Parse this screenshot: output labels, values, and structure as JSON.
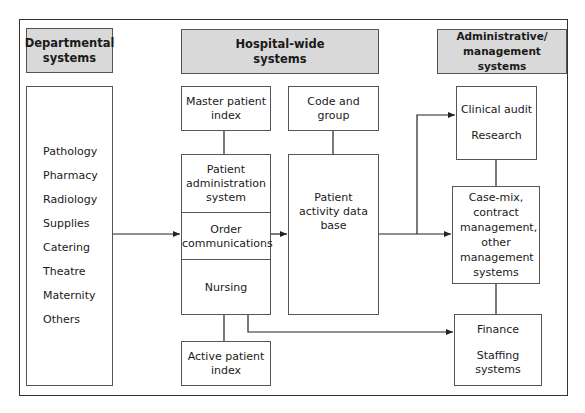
{
  "columns": {
    "departmental": {
      "header": "Departmental systems",
      "items": [
        "Pathology",
        "Pharmacy",
        "Radiology",
        "Supplies",
        "Catering",
        "Theatre",
        "Maternity",
        "Others"
      ]
    },
    "hospital_wide": {
      "header": "Hospital-wide systems",
      "master_patient_index": "Master patient index",
      "code_and_group": "Code and group",
      "patient_administration_system": "Patient administration system",
      "order_communications": "Order communications",
      "nursing": "Nursing",
      "patient_activity_database": "Patient activity data base",
      "active_patient_index": "Active patient index"
    },
    "administrative": {
      "header": "Administrative/ management systems",
      "clinical_audit": "Clinical audit",
      "research": "Research",
      "case_mix": "Case-mix, contract management, other management systems",
      "finance": "Finance",
      "staffing": "Staffing systems"
    }
  },
  "colors": {
    "header_fill": "#d9d9d9",
    "line": "#222222",
    "border": "#555555"
  }
}
